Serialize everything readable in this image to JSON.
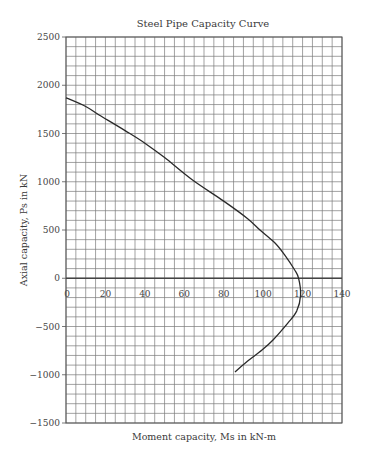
{
  "chart_data": {
    "type": "line",
    "title": "Steel Pipe Capacity Curve",
    "xlabel": "Moment capacity, Ms in kN-m",
    "ylabel": "Axial capacity, Ps in kN",
    "xlim": [
      0,
      140
    ],
    "ylim": [
      -1500,
      2500
    ],
    "x_ticks": [
      0,
      20,
      40,
      60,
      80,
      100,
      120,
      140
    ],
    "y_ticks": [
      -1500,
      -1000,
      -500,
      0,
      500,
      1000,
      1500,
      2000,
      2500
    ],
    "x_minor_step": 5,
    "y_minor_step": 100,
    "grid": true,
    "legend": null,
    "series": [
      {
        "name": "Capacity curve",
        "color": "#2a2a2a",
        "points": [
          [
            0,
            1870
          ],
          [
            10,
            1780
          ],
          [
            17,
            1690
          ],
          [
            30,
            1530
          ],
          [
            40,
            1400
          ],
          [
            50,
            1250
          ],
          [
            64,
            1020
          ],
          [
            80,
            800
          ],
          [
            92,
            620
          ],
          [
            98.4,
            500
          ],
          [
            106,
            365
          ],
          [
            111,
            240
          ],
          [
            116,
            85
          ],
          [
            118,
            0
          ],
          [
            119,
            -175
          ],
          [
            117,
            -340
          ],
          [
            112.5,
            -465
          ],
          [
            105,
            -640
          ],
          [
            99.4,
            -745
          ],
          [
            92,
            -860
          ],
          [
            85.7,
            -970
          ]
        ]
      }
    ]
  },
  "plot_area": {
    "left": 66,
    "top": 37,
    "right": 342,
    "bottom": 423
  }
}
